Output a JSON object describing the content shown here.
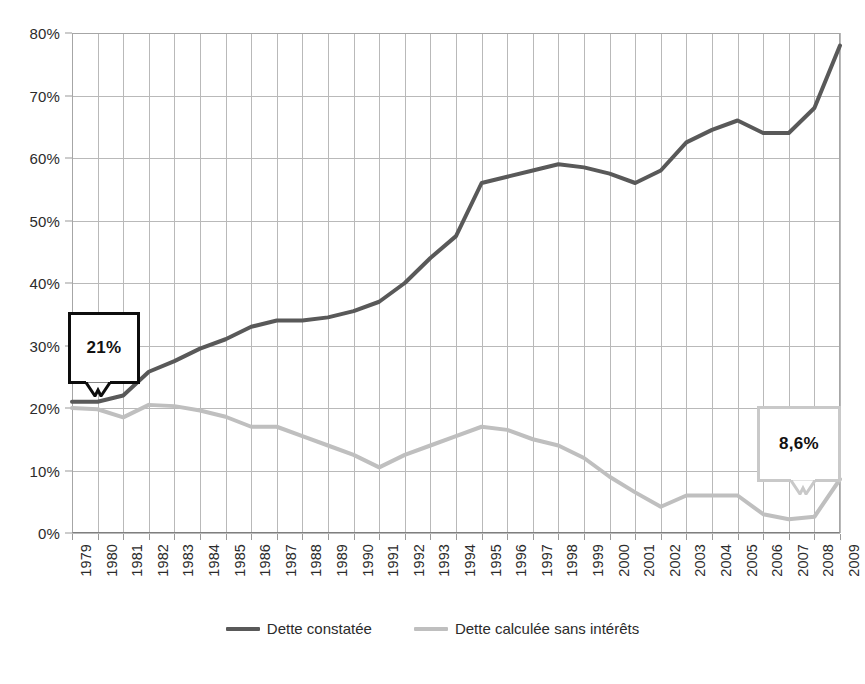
{
  "chart_data": {
    "type": "line",
    "title": "",
    "subtitle": "",
    "xlabel": "",
    "ylabel": "",
    "grid": true,
    "legend_position": "bottom",
    "xlim": [
      1979,
      2009
    ],
    "ylim": [
      0,
      80
    ],
    "y_tick_labels": [
      "0%",
      "10%",
      "20%",
      "30%",
      "40%",
      "50%",
      "60%",
      "70%",
      "80%"
    ],
    "y_tick_values": [
      0,
      10,
      20,
      30,
      40,
      50,
      60,
      70,
      80
    ],
    "categories": [
      "1979",
      "1980",
      "1981",
      "1982",
      "1983",
      "1984",
      "1985",
      "1986",
      "1987",
      "1988",
      "1989",
      "1990",
      "1991",
      "1992",
      "1993",
      "1994",
      "1995",
      "1996",
      "1997",
      "1998",
      "1999",
      "2000",
      "2001",
      "2002",
      "2003",
      "2004",
      "2005",
      "2006",
      "2007",
      "2008",
      "2009"
    ],
    "series": [
      {
        "name": "Dette constatée",
        "color": "#595959",
        "values": [
          21.0,
          21.0,
          22.0,
          25.8,
          27.5,
          29.5,
          31.0,
          33.0,
          34.0,
          34.0,
          34.5,
          35.5,
          37.0,
          40.0,
          44.0,
          47.5,
          56.0,
          57.0,
          58.0,
          59.0,
          58.5,
          57.5,
          56.0,
          58.0,
          62.5,
          64.5,
          66.0,
          64.0,
          64.0,
          68.0,
          78.0
        ]
      },
      {
        "name": "Dette calculée sans intérêts",
        "color": "#bfbfbf",
        "values": [
          20.0,
          19.8,
          18.5,
          20.5,
          20.3,
          19.6,
          18.6,
          17.0,
          17.0,
          15.5,
          14.0,
          12.5,
          10.5,
          12.5,
          14.0,
          15.5,
          17.0,
          16.5,
          15.0,
          14.0,
          12.0,
          9.0,
          6.5,
          4.2,
          6.0,
          6.0,
          6.0,
          3.0,
          2.2,
          2.6,
          8.6
        ]
      }
    ],
    "annotations": [
      {
        "id": "callout-left",
        "text": "21%",
        "border_color": "#0d0d0d",
        "points_to_year": "1979",
        "points_to_value": 21.0
      },
      {
        "id": "callout-right",
        "text": "8,6%",
        "border_color": "#c9c9c9",
        "points_to_year": "2009",
        "points_to_value": 8.6
      }
    ]
  },
  "legend": {
    "items": [
      {
        "label": "Dette constatée",
        "color": "#595959"
      },
      {
        "label": "Dette calculée sans intérêts",
        "color": "#bfbfbf"
      }
    ]
  }
}
